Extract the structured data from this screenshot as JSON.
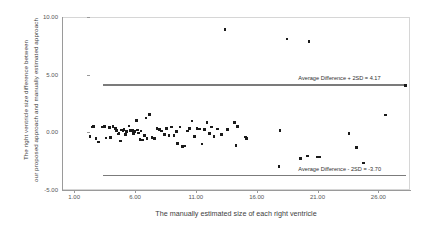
{
  "chart_data": {
    "type": "scatter",
    "title": "",
    "xlabel": "The manually estimated size of each right ventricle",
    "ylabel_line1": "The right ventricle size difference between",
    "ylabel_line2": "our proposed approach and manually estimated approach",
    "xlim": [
      0.0,
      28.6
    ],
    "ylim": [
      -5.0,
      10.0
    ],
    "xticks": [
      1.0,
      6.0,
      11.0,
      16.0,
      21.0,
      26.0
    ],
    "xtick_labels": [
      "1.00",
      "6.00",
      "11.00",
      "16.00",
      "21.00",
      "26.00"
    ],
    "yticks": [
      -5.0,
      0.0,
      5.0,
      10.0
    ],
    "ytick_labels": [
      "-5.00",
      "0.00",
      "5.00",
      "10.00"
    ],
    "grid": false,
    "legend": "none",
    "marker_color": "#1a1a1a",
    "line_color": "#7b7b7b",
    "reference_lines": [
      {
        "name": "upper-limit-of-agreement",
        "label": "Average Difference + 2SD = 4.17",
        "y": 4.17,
        "x_start": 3.4,
        "x_end": 28.3
      },
      {
        "name": "lower-limit-of-agreement",
        "label": "Average Difference - 2SD = -3.70",
        "y": -3.7,
        "x_start": 3.4,
        "x_end": 28.3
      }
    ],
    "points": [
      [
        2.3,
        -0.35
      ],
      [
        2.5,
        0.45
      ],
      [
        2.6,
        0.5
      ],
      [
        2.8,
        -0.55
      ],
      [
        3.0,
        -0.85
      ],
      [
        3.3,
        0.45
      ],
      [
        3.5,
        0.5
      ],
      [
        3.6,
        -0.5
      ],
      [
        3.9,
        0.4
      ],
      [
        4.0,
        -0.45
      ],
      [
        4.2,
        0.5
      ],
      [
        4.4,
        0.35
      ],
      [
        4.5,
        0.15
      ],
      [
        4.6,
        -0.15
      ],
      [
        4.7,
        -0.1
      ],
      [
        4.8,
        -0.75
      ],
      [
        4.9,
        0.2
      ],
      [
        5.0,
        0.1
      ],
      [
        5.1,
        0.25
      ],
      [
        5.2,
        -0.2
      ],
      [
        5.3,
        0.05
      ],
      [
        5.5,
        0.55
      ],
      [
        5.6,
        0.15
      ],
      [
        5.7,
        0.1
      ],
      [
        5.8,
        0.15
      ],
      [
        5.9,
        -0.1
      ],
      [
        6.0,
        0.05
      ],
      [
        6.1,
        1.05
      ],
      [
        6.2,
        0.2
      ],
      [
        6.3,
        -0.05
      ],
      [
        6.4,
        -0.6
      ],
      [
        6.5,
        0.1
      ],
      [
        6.6,
        -0.65
      ],
      [
        6.8,
        -0.3
      ],
      [
        6.9,
        1.25
      ],
      [
        7.0,
        -0.55
      ],
      [
        7.2,
        1.55
      ],
      [
        7.4,
        -0.45
      ],
      [
        7.6,
        -0.55
      ],
      [
        7.8,
        0.35
      ],
      [
        8.0,
        0.25
      ],
      [
        8.2,
        0.1
      ],
      [
        8.4,
        -0.2
      ],
      [
        8.6,
        0.35
      ],
      [
        8.8,
        -0.3
      ],
      [
        9.0,
        0.45
      ],
      [
        9.2,
        -0.25
      ],
      [
        9.4,
        0.05
      ],
      [
        9.5,
        -0.95
      ],
      [
        9.7,
        0.45
      ],
      [
        9.9,
        -1.25
      ],
      [
        10.1,
        -1.2
      ],
      [
        10.3,
        0.1
      ],
      [
        10.5,
        0.35
      ],
      [
        10.7,
        1.0
      ],
      [
        10.9,
        -0.35
      ],
      [
        11.1,
        0.35
      ],
      [
        11.3,
        0.3
      ],
      [
        11.5,
        -1.0
      ],
      [
        11.7,
        0.25
      ],
      [
        11.9,
        0.85
      ],
      [
        12.1,
        -0.1
      ],
      [
        12.3,
        0.45
      ],
      [
        12.5,
        -0.35
      ],
      [
        12.8,
        0.3
      ],
      [
        13.1,
        -0.2
      ],
      [
        13.4,
        8.9
      ],
      [
        13.6,
        0.25
      ],
      [
        14.2,
        0.85
      ],
      [
        14.4,
        0.5
      ],
      [
        14.3,
        -1.15
      ],
      [
        15.1,
        -0.4
      ],
      [
        15.15,
        -0.55
      ],
      [
        17.9,
        0.15
      ],
      [
        17.85,
        -2.95
      ],
      [
        18.5,
        8.1
      ],
      [
        19.6,
        -2.25
      ],
      [
        20.2,
        -2.05
      ],
      [
        20.3,
        7.85
      ],
      [
        21.0,
        -2.15
      ],
      [
        21.15,
        -2.15
      ],
      [
        23.6,
        -0.1
      ],
      [
        24.2,
        -1.3
      ],
      [
        24.8,
        -2.65
      ],
      [
        26.6,
        1.5
      ],
      [
        28.25,
        4.05
      ]
    ]
  }
}
